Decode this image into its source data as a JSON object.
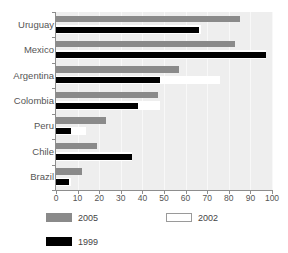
{
  "title_sliver": "     ",
  "axis": {
    "x_ticks": [
      "0",
      "10",
      "20",
      "30",
      "40",
      "50",
      "60",
      "70",
      "80",
      "90",
      "100"
    ]
  },
  "legend": {
    "items": [
      {
        "label": "2005",
        "color": "#8a8a8a",
        "swatch": "legend-swatch-2005"
      },
      {
        "label": "2002",
        "color": "#ffffff",
        "swatch": "legend-swatch-2002"
      },
      {
        "label": "1999",
        "color": "#000000",
        "swatch": "legend-swatch-1999"
      }
    ]
  },
  "chart_data": {
    "type": "bar",
    "orientation": "horizontal",
    "title": "",
    "xlabel": "",
    "ylabel": "",
    "xlim": [
      0,
      100
    ],
    "grid": true,
    "legend_position": "bottom",
    "categories": [
      "Uruguay",
      "Mexico",
      "Argentina",
      "Colombia",
      "Peru",
      "Chile",
      "Brazil"
    ],
    "series": [
      {
        "name": "2005",
        "color": "#8a8a8a",
        "values": [
          85,
          83,
          57,
          47,
          23,
          19,
          12
        ]
      },
      {
        "name": "2002",
        "color": "#ffffff",
        "values": [
          67,
          97,
          76,
          48,
          14,
          35,
          7
        ]
      },
      {
        "name": "1999",
        "color": "#000000",
        "values": [
          66,
          97,
          48,
          38,
          7,
          35,
          6
        ]
      }
    ]
  }
}
